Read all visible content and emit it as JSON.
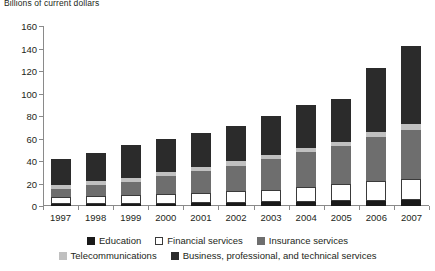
{
  "chart_data": {
    "type": "bar",
    "subtype": "stacked-bar",
    "title": "Billions of current dollars",
    "xlabel": "",
    "ylabel": "",
    "ylim": [
      0,
      160
    ],
    "ytick_step": 20,
    "yticks": [
      0,
      20,
      40,
      60,
      80,
      100,
      120,
      140,
      160
    ],
    "grid": false,
    "legend_position": "bottom",
    "categories": [
      "1997",
      "1998",
      "1999",
      "2000",
      "2001",
      "2002",
      "2003",
      "2004",
      "2005",
      "2006",
      "2007"
    ],
    "series": [
      {
        "name": "Education",
        "color": "#1a1a1a",
        "values": [
          1.5,
          1.5,
          1.8,
          2.0,
          2.4,
          2.8,
          3.2,
          3.8,
          4.4,
          4.8,
          5.2
        ]
      },
      {
        "name": "Financial services",
        "color": "#ffffff",
        "values": [
          6.5,
          7.0,
          7.7,
          9.0,
          9.6,
          10.2,
          11.3,
          13.2,
          15.6,
          17.2,
          18.8
        ]
      },
      {
        "name": "Insurance services",
        "color": "#6e6e6e",
        "values": [
          7.0,
          10.0,
          12.0,
          15.5,
          19.0,
          23.0,
          27.0,
          31.0,
          33.0,
          39.0,
          44.0
        ]
      },
      {
        "name": "Telecommunications",
        "color": "#c0c0c0",
        "values": [
          4.0,
          4.0,
          3.8,
          4.0,
          4.0,
          4.0,
          4.2,
          4.0,
          4.0,
          4.5,
          5.0
        ]
      },
      {
        "name": "Business, professional, and technical services",
        "color": "#2b2b2b",
        "values": [
          23.0,
          24.5,
          28.7,
          29.5,
          30.0,
          31.0,
          34.3,
          38.0,
          38.0,
          57.5,
          69.0
        ]
      }
    ],
    "totals": [
      42,
      47,
      54,
      60,
      65,
      71,
      80,
      90,
      95,
      123,
      142
    ]
  }
}
